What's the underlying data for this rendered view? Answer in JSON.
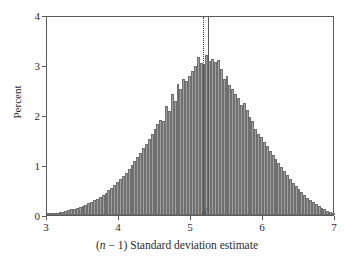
{
  "chart_data": {
    "type": "bar",
    "title": "",
    "subtitle": "",
    "xlabel": "(n − 1) Standard deviation estimate",
    "xlabel_parts": {
      "prefix": "(",
      "italic": "n",
      "middle": " − 1) Standard deviation estimate"
    },
    "ylabel": "Percent",
    "xlim": [
      3,
      7
    ],
    "ylim": [
      0,
      4
    ],
    "xticks": [
      3,
      4,
      5,
      6,
      7
    ],
    "xtick_labels": [
      "3",
      "4",
      "5",
      "6",
      "7"
    ],
    "yticks": [
      0,
      1,
      2,
      3,
      4
    ],
    "ytick_labels": [
      "0",
      "1",
      "2",
      "3",
      "4"
    ],
    "grid": false,
    "legend": "none",
    "bar_fill_color": "#a0a0a0",
    "bar_edge_color": "#6f6f6f",
    "axis_color": "#5a5a5a",
    "bin_width": 0.04,
    "annotations": [
      {
        "name": "sigma-hat-label",
        "text": "σ̂",
        "x": 5.2,
        "y": 0
      }
    ],
    "reference_lines": [
      {
        "name": "dotted-reference-line",
        "x": 5.17,
        "style": "dotted",
        "color": "#3d3d3d"
      },
      {
        "name": "solid-reference-line",
        "x": 5.24,
        "style": "solid",
        "color": "#5a5a5a"
      }
    ],
    "x": [
      3.02,
      3.06,
      3.1,
      3.14,
      3.18,
      3.22,
      3.26,
      3.3,
      3.34,
      3.38,
      3.42,
      3.46,
      3.5,
      3.54,
      3.58,
      3.62,
      3.66,
      3.7,
      3.74,
      3.78,
      3.82,
      3.86,
      3.9,
      3.94,
      3.98,
      4.02,
      4.06,
      4.1,
      4.14,
      4.18,
      4.22,
      4.26,
      4.3,
      4.34,
      4.38,
      4.42,
      4.46,
      4.5,
      4.54,
      4.58,
      4.62,
      4.66,
      4.7,
      4.74,
      4.78,
      4.82,
      4.86,
      4.9,
      4.94,
      4.98,
      5.02,
      5.06,
      5.1,
      5.14,
      5.18,
      5.22,
      5.26,
      5.3,
      5.34,
      5.38,
      5.42,
      5.46,
      5.5,
      5.54,
      5.58,
      5.62,
      5.66,
      5.7,
      5.74,
      5.78,
      5.82,
      5.86,
      5.9,
      5.94,
      5.98,
      6.02,
      6.06,
      6.1,
      6.14,
      6.18,
      6.22,
      6.26,
      6.3,
      6.34,
      6.38,
      6.42,
      6.46,
      6.5,
      6.54,
      6.58,
      6.62,
      6.66,
      6.7,
      6.74,
      6.78,
      6.82,
      6.86,
      6.9,
      6.94,
      6.98
    ],
    "values": [
      0.02,
      0.03,
      0.04,
      0.05,
      0.06,
      0.07,
      0.09,
      0.11,
      0.12,
      0.13,
      0.15,
      0.17,
      0.19,
      0.21,
      0.24,
      0.27,
      0.3,
      0.33,
      0.37,
      0.41,
      0.45,
      0.5,
      0.55,
      0.6,
      0.66,
      0.72,
      0.78,
      0.85,
      0.92,
      1.0,
      1.08,
      1.16,
      1.25,
      1.34,
      1.43,
      1.52,
      1.62,
      1.72,
      1.82,
      1.9,
      1.89,
      2.18,
      2.08,
      2.42,
      2.28,
      2.62,
      2.52,
      2.72,
      2.68,
      2.78,
      2.88,
      2.98,
      3.16,
      3.04,
      3.02,
      3.2,
      3.08,
      3.12,
      3.06,
      3.1,
      2.92,
      2.72,
      2.78,
      2.6,
      2.52,
      2.42,
      2.34,
      2.2,
      2.24,
      2.1,
      1.96,
      1.88,
      1.72,
      1.62,
      1.56,
      1.46,
      1.38,
      1.28,
      1.2,
      1.12,
      1.04,
      0.96,
      0.88,
      0.8,
      0.72,
      0.65,
      0.58,
      0.52,
      0.46,
      0.4,
      0.35,
      0.3,
      0.26,
      0.22,
      0.18,
      0.15,
      0.12,
      0.09,
      0.06,
      0.04
    ]
  }
}
